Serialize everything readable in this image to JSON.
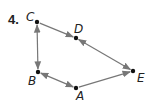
{
  "problem": {
    "number": "4."
  },
  "colors": {
    "edge": "#777777",
    "point": "#111111",
    "text": "#222222"
  },
  "vertices": [
    {
      "id": "C",
      "label": "C",
      "x": 37,
      "y": 22,
      "lx": 26,
      "ly": 21
    },
    {
      "id": "D",
      "label": "D",
      "x": 76,
      "y": 38,
      "lx": 74,
      "ly": 33
    },
    {
      "id": "E",
      "label": "E",
      "x": 133,
      "y": 71,
      "lx": 137,
      "ly": 82
    },
    {
      "id": "B",
      "label": "B",
      "x": 38,
      "y": 72,
      "lx": 28,
      "ly": 85
    },
    {
      "id": "A",
      "label": "A",
      "x": 76,
      "y": 88,
      "lx": 76,
      "ly": 100
    }
  ],
  "edges": [
    {
      "from": "C",
      "to": "D",
      "arrows": "end"
    },
    {
      "from": "D",
      "to": "E",
      "arrows": "both"
    },
    {
      "from": "C",
      "to": "B",
      "arrows": "both"
    },
    {
      "from": "B",
      "to": "A",
      "arrows": "both"
    },
    {
      "from": "A",
      "to": "E",
      "arrows": "end"
    }
  ]
}
